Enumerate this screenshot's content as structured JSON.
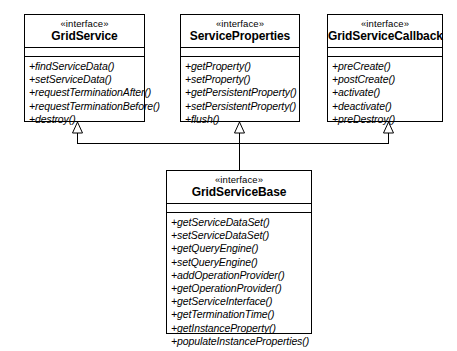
{
  "diagram": {
    "type": "uml-class-diagram",
    "background": "#ffffff",
    "line_color": "#000000",
    "classes": [
      {
        "id": "grid-service",
        "stereotype": "«interface»",
        "name": "GridService",
        "x": 24,
        "y": 14,
        "width": 121,
        "height": 108,
        "attributes": [],
        "methods": [
          "+findServiceData()",
          "+setServiceData()",
          "+requestTerminationAfter()",
          "+requestTerminationBefore()",
          "+destroy()"
        ]
      },
      {
        "id": "service-properties",
        "stereotype": "«interface»",
        "name": "ServiceProperties",
        "x": 180,
        "y": 14,
        "width": 120,
        "height": 108,
        "attributes": [],
        "methods": [
          "+getProperty()",
          "+setProperty()",
          "+getPersistentProperty()",
          "+setPersistentProperty()",
          "+flush()"
        ]
      },
      {
        "id": "grid-service-callback",
        "stereotype": "«interface»",
        "name": "GridServiceCallback",
        "x": 327,
        "y": 14,
        "width": 116,
        "height": 108,
        "attributes": [],
        "methods": [
          "+preCreate()",
          "+postCreate()",
          "+activate()",
          "+deactivate()",
          "+preDestroy()"
        ]
      },
      {
        "id": "grid-service-base",
        "stereotype": "«interface»",
        "name": "GridServiceBase",
        "x": 166,
        "y": 170,
        "width": 146,
        "height": 164,
        "attributes": [],
        "methods": [
          "+getServiceDataSet()",
          "+setServiceDataSet()",
          "+getQueryEngine()",
          "+setQueryEngine()",
          "+addOperationProvider()",
          "+getOperationProvider()",
          "+getServiceInterface()",
          "+getTerminationTime()",
          "+getInstanceProperty()",
          "+populateInstanceProperties()"
        ]
      }
    ],
    "relationships": [
      {
        "type": "generalization",
        "from": "grid-service-base",
        "to": "grid-service",
        "arrow": "hollow-triangle"
      },
      {
        "type": "generalization",
        "from": "grid-service-base",
        "to": "service-properties",
        "arrow": "hollow-triangle"
      },
      {
        "type": "generalization",
        "from": "grid-service-base",
        "to": "grid-service-callback",
        "arrow": "hollow-triangle"
      }
    ]
  }
}
